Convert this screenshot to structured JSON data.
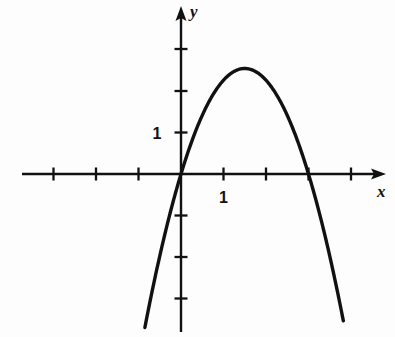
{
  "figure": {
    "kind": "cartesian-graph",
    "background_color": "#fdfdfd",
    "ink_color": "#111111"
  },
  "labels": {
    "y_axis_name": "y",
    "x_axis_name": "x",
    "x_unit_label": "1",
    "y_unit_label": "1"
  },
  "chart_data": {
    "type": "line",
    "title": "",
    "xlabel": "x",
    "ylabel": "y",
    "grid": false,
    "legend": "none",
    "axis_arrows": [
      "x-positive",
      "y-positive"
    ],
    "xlim": [
      -3.75,
      4.75
    ],
    "ylim": [
      -3.85,
      4.0
    ],
    "x_ticks": [
      -3,
      -2,
      -1,
      1,
      2,
      3,
      4
    ],
    "y_ticks": [
      -3,
      -2,
      -1,
      1,
      2,
      3
    ],
    "x_tick_labels": {
      "1": "1"
    },
    "y_tick_labels": {
      "1": "1"
    },
    "curves": [
      {
        "name": "downward-parabola",
        "equation": "y = -1.13 x (x - 3)",
        "leading_coefficient": -1.13,
        "roots": [
          0,
          3
        ],
        "vertex": [
          1.5,
          2.55
        ],
        "opens": "down",
        "x_domain": [
          -0.85,
          3.82
        ],
        "points": [
          {
            "x": -0.85,
            "y": -3.7
          },
          {
            "x": -0.5,
            "y": -1.98
          },
          {
            "x": 0.0,
            "y": 0.0
          },
          {
            "x": 0.5,
            "y": 1.41
          },
          {
            "x": 1.0,
            "y": 2.26
          },
          {
            "x": 1.5,
            "y": 2.54
          },
          {
            "x": 2.0,
            "y": 2.26
          },
          {
            "x": 2.5,
            "y": 1.41
          },
          {
            "x": 3.0,
            "y": 0.0
          },
          {
            "x": 3.4,
            "y": -1.54
          },
          {
            "x": 3.82,
            "y": -3.54
          }
        ]
      }
    ]
  }
}
